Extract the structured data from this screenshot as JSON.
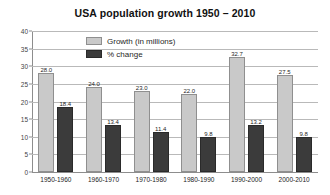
{
  "chart_data": {
    "type": "bar",
    "title": "USA population growth 1950 – 2010",
    "xlabel": "",
    "ylabel": "",
    "ylim": [
      0,
      40
    ],
    "yticks": [
      0,
      5,
      10,
      15,
      20,
      25,
      30,
      35,
      40
    ],
    "grid": true,
    "legend_position": "top-center-inside",
    "categories": [
      "1950-1960",
      "1960-1970",
      "1970-1980",
      "1980-1990",
      "1990-2000",
      "2000-2010"
    ],
    "series": [
      {
        "name": "Growth (in millions)",
        "color": "#c9c9c9",
        "values": [
          28.0,
          24.0,
          23.0,
          22.0,
          32.7,
          27.5
        ],
        "labels": [
          "28.0",
          "24.0",
          "23.0",
          "22.0",
          "32.7",
          "27.5"
        ]
      },
      {
        "name": "% change",
        "color": "#3b3b3b",
        "values": [
          18.4,
          13.4,
          11.4,
          9.8,
          13.2,
          9.8
        ],
        "labels": [
          "18.4",
          "13.4",
          "11.4",
          "9.8",
          "13.2",
          "9.8"
        ]
      }
    ]
  },
  "colors": {
    "growth": "#c9c9c9",
    "change": "#3b3b3b",
    "grid": "#b9b9b9",
    "axis": "#8d8d8d",
    "text": "#1a1a1a",
    "background": "#ffffff"
  }
}
